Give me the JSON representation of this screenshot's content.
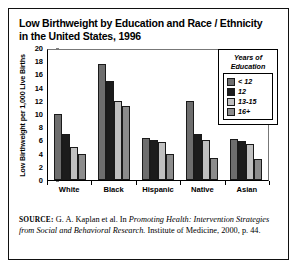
{
  "figure": {
    "title": "Low Birthweight by Education and Race / Ethnicity in the United States, 1996",
    "source_prefix": "SOURCE:",
    "source_text_1": " G. A. Kaplan et al. In ",
    "source_italic_1": "Promoting Health: Intervention Strategies from Social and Behavioral Research.",
    "source_text_2": " Institute of Medicine, 2000, p. 44."
  },
  "legend": {
    "title_line1": "Years of",
    "title_line2": "Education",
    "entries": [
      {
        "label": "< 12",
        "color": "#6e6e6e"
      },
      {
        "label": "12",
        "color": "#1c1c1c"
      },
      {
        "label": "13-15",
        "color": "#c0c0c0"
      },
      {
        "label": "16+",
        "color": "#8c8c8c"
      }
    ]
  },
  "chart_data": {
    "type": "bar",
    "title": "Low Birthweight by Education and Race / Ethnicity in the United States, 1996",
    "xlabel": "",
    "ylabel": "Low Birthweight per 1,000 Live Births",
    "ylim": [
      0,
      20
    ],
    "yticks": [
      0,
      2,
      4,
      6,
      8,
      10,
      12,
      14,
      16,
      18,
      20
    ],
    "grid": false,
    "legend_position": "top-right",
    "legend_title": "Years of Education",
    "categories": [
      "White",
      "Black",
      "Hispanic",
      "Native",
      "Asian"
    ],
    "series": [
      {
        "name": "< 12",
        "color": "#6e6e6e",
        "values": [
          10.0,
          17.6,
          6.3,
          11.9,
          6.2
        ]
      },
      {
        "name": "12",
        "color": "#1c1c1c",
        "values": [
          7.0,
          15.0,
          6.0,
          7.0,
          5.9
        ]
      },
      {
        "name": "13-15",
        "color": "#c0c0c0",
        "values": [
          5.0,
          12.0,
          5.8,
          6.0,
          5.4
        ]
      },
      {
        "name": "16+",
        "color": "#8c8c8c",
        "values": [
          4.0,
          11.2,
          4.0,
          3.3,
          3.2
        ]
      }
    ]
  }
}
